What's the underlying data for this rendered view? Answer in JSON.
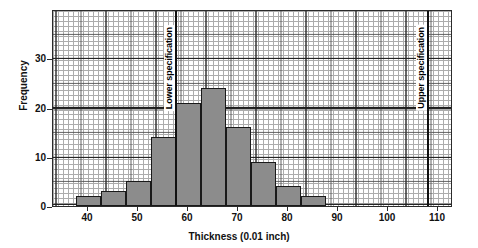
{
  "chart_data": {
    "type": "bar",
    "title": "",
    "subtitle": "",
    "xlabel": "Thickness (0.01 inch)",
    "ylabel": "Frequency",
    "xlim": [
      33,
      113
    ],
    "ylim": [
      0,
      40
    ],
    "grid": true,
    "grid_style": "graph-paper",
    "legend": "none",
    "bin_width": 5,
    "xticks": [
      40,
      50,
      60,
      70,
      80,
      90,
      100,
      110
    ],
    "yticks": [
      0,
      10,
      20,
      30
    ],
    "bars": [
      {
        "bin_start": 37.5,
        "bin_end": 42.5,
        "value": 2
      },
      {
        "bin_start": 42.5,
        "bin_end": 47.5,
        "value": 3
      },
      {
        "bin_start": 47.5,
        "bin_end": 52.5,
        "value": 5
      },
      {
        "bin_start": 52.5,
        "bin_end": 57.5,
        "value": 14
      },
      {
        "bin_start": 57.5,
        "bin_end": 62.5,
        "value": 21
      },
      {
        "bin_start": 62.5,
        "bin_end": 67.5,
        "value": 24
      },
      {
        "bin_start": 67.5,
        "bin_end": 72.5,
        "value": 16
      },
      {
        "bin_start": 72.5,
        "bin_end": 77.5,
        "value": 9
      },
      {
        "bin_start": 77.5,
        "bin_end": 82.5,
        "value": 4
      },
      {
        "bin_start": 82.5,
        "bin_end": 87.5,
        "value": 2
      }
    ],
    "annotations": [
      {
        "name": "lower-specification",
        "label": "Lower specification",
        "x": 57.5
      },
      {
        "name": "upper-specification",
        "label": "Upper specification",
        "x": 108
      }
    ],
    "bar_fill": "#8c8c8c",
    "bar_stroke": "#1a1a1a",
    "axis_color": "#2b2b2b"
  }
}
